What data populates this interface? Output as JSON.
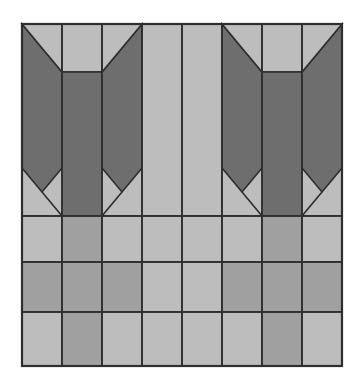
{
  "figure": {
    "type": "geometric-pattern",
    "background_color": "#ffffff",
    "canvas": {
      "width": 358,
      "height": 388
    }
  },
  "palette": {
    "light": "#bdbdbd",
    "mid": "#a0a0a0",
    "dark": "#6e6e6e",
    "outline": "#2f2f2f",
    "background": "#ffffff"
  },
  "geometry": {
    "block_left": 22,
    "block_top": 24,
    "block_right": 342,
    "block_bottom": 366,
    "column_width": 40,
    "column_edges": [
      22,
      62,
      102,
      142,
      182,
      222,
      262,
      302,
      342
    ],
    "upper_section": {
      "top": 24,
      "bottom": 216
    },
    "lower_section": {
      "top": 216,
      "bottom": 366
    },
    "horizontal_rules": [
      216,
      262,
      312
    ],
    "shoulder_y": 72,
    "hip_y": 168,
    "mirror_axis_x": 182,
    "stroke_width": 1.6
  },
  "columns": [
    {
      "index": 1,
      "x": 22,
      "upper_shape": "dark-notch-right",
      "lower_cells": [
        "light",
        "mid",
        "light"
      ]
    },
    {
      "index": 2,
      "x": 62,
      "upper_shape": "light-top-dark-body",
      "lower_cells": [
        "mid",
        "mid",
        "mid"
      ]
    },
    {
      "index": 3,
      "x": 102,
      "upper_shape": "dark-notch-left",
      "lower_cells": [
        "light",
        "mid",
        "light"
      ]
    },
    {
      "index": 4,
      "x": 142,
      "upper_shape": "all-light",
      "lower_cells": [
        "light",
        "light",
        "light"
      ]
    },
    {
      "index": 5,
      "x": 182,
      "upper_shape": "all-light",
      "lower_cells": [
        "light",
        "light",
        "light"
      ]
    },
    {
      "index": 6,
      "x": 222,
      "upper_shape": "dark-notch-right",
      "lower_cells": [
        "light",
        "mid",
        "light"
      ]
    },
    {
      "index": 7,
      "x": 262,
      "upper_shape": "light-top-dark-body",
      "lower_cells": [
        "mid",
        "mid",
        "mid"
      ]
    },
    {
      "index": 8,
      "x": 302,
      "upper_shape": "dark-notch-left",
      "lower_cells": [
        "light",
        "mid",
        "light"
      ]
    }
  ],
  "chart_data": {
    "type": "heatmap",
    "xlabel": "",
    "ylabel": "",
    "grid": true,
    "legend_position": "none",
    "categories": [
      "col1",
      "col2",
      "col3",
      "col4",
      "col5",
      "col6",
      "col7",
      "col8"
    ],
    "row_bands": [
      "upper",
      "lower-top",
      "lower-mid",
      "lower-bottom"
    ],
    "series": [
      {
        "name": "upper",
        "values": [
          "dark",
          "dark",
          "dark",
          "light",
          "light",
          "dark",
          "dark",
          "dark"
        ]
      },
      {
        "name": "lower-top",
        "values": [
          "light",
          "mid",
          "light",
          "light",
          "light",
          "light",
          "mid",
          "light"
        ]
      },
      {
        "name": "lower-mid",
        "values": [
          "mid",
          "mid",
          "mid",
          "light",
          "light",
          "mid",
          "mid",
          "mid"
        ]
      },
      {
        "name": "lower-bottom",
        "values": [
          "light",
          "mid",
          "light",
          "light",
          "light",
          "light",
          "mid",
          "light"
        ]
      }
    ]
  }
}
